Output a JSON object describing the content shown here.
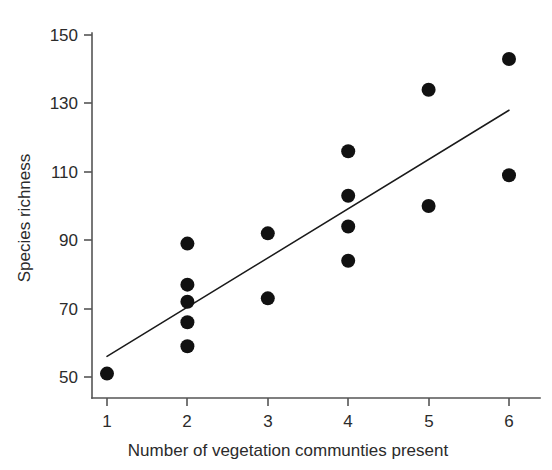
{
  "chart_data": {
    "type": "scatter",
    "title": "",
    "subtitle": "",
    "xlabel": "Number of vegetation communties present",
    "ylabel": "Species richness",
    "xlim": [
      0.72,
      6.25
    ],
    "ylim": [
      45.5,
      150
    ],
    "xticks": [
      1,
      2,
      3,
      4,
      5,
      6
    ],
    "xtick_labels": [
      "1",
      "2",
      "3",
      "4",
      "5",
      "6"
    ],
    "yticks": [
      50,
      70,
      90,
      110,
      130,
      150
    ],
    "ytick_labels": [
      "50",
      "70",
      "90",
      "110",
      "130",
      "150"
    ],
    "grid": false,
    "legend": null,
    "marker": {
      "shape": "circle",
      "color": "#111111",
      "radius_px": 7
    },
    "points": [
      {
        "x": 1,
        "y": 51
      },
      {
        "x": 2,
        "y": 89
      },
      {
        "x": 2,
        "y": 77
      },
      {
        "x": 2,
        "y": 72
      },
      {
        "x": 2,
        "y": 66
      },
      {
        "x": 2,
        "y": 59
      },
      {
        "x": 3,
        "y": 92
      },
      {
        "x": 3,
        "y": 73
      },
      {
        "x": 4,
        "y": 116
      },
      {
        "x": 4,
        "y": 103
      },
      {
        "x": 4,
        "y": 94
      },
      {
        "x": 4,
        "y": 84
      },
      {
        "x": 5,
        "y": 134
      },
      {
        "x": 5,
        "y": 100
      },
      {
        "x": 6,
        "y": 143
      },
      {
        "x": 6,
        "y": 109
      }
    ],
    "trendline": {
      "type": "linear-fit",
      "color": "#1a1a1a",
      "x_start": 1.0,
      "y_start": 56,
      "x_end": 6.0,
      "y_end": 128
    }
  },
  "axes": {
    "x_axis_name": "x-axis",
    "y_axis_name": "y-axis"
  }
}
